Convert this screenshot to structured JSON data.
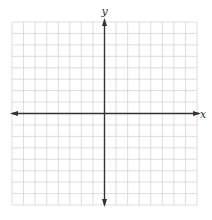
{
  "diagram": {
    "type": "coordinate-plane",
    "axes": {
      "x_label": "x",
      "y_label": "y"
    },
    "grid": {
      "columns": 16,
      "rows": 16,
      "left": 12,
      "top": 22,
      "right": 197,
      "bottom": 205,
      "origin_x": 104.5,
      "origin_y": 113.5
    },
    "colors": {
      "grid": "#d4d4d4",
      "axis": "#333333",
      "background": "#ffffff"
    }
  }
}
